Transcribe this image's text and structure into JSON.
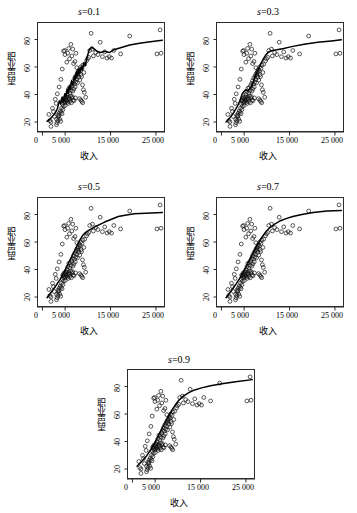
{
  "figure": {
    "background": "#ffffff",
    "panel_border_color": "#2b2b2b",
    "curve_color": "#000000",
    "point_color": "#111111"
  },
  "axis": {
    "xlabel": "收入",
    "ylabel": "职业声望",
    "xticks": [
      "0",
      "5 000",
      "15 000",
      "25 000"
    ],
    "xtick_values": [
      0,
      5000,
      15000,
      25000
    ],
    "yticks": [
      "20",
      "40",
      "60",
      "80"
    ],
    "ytick_values": [
      20,
      40,
      60,
      80
    ],
    "xlim": [
      -1200,
      27000
    ],
    "ylim": [
      12,
      92
    ]
  },
  "titles": {
    "p1": "s=0.1",
    "p2": "s=0.3",
    "p3": "s=0.5",
    "p4": "s=0.7",
    "p5": "s=0.9",
    "sym": "s",
    "eq1": "=0.1",
    "eq2": "=0.3",
    "eq3": "=0.5",
    "eq4": "=0.7",
    "eq5": "=0.9"
  },
  "chart_data": {
    "type": "scatter",
    "title": "",
    "xlabel": "收入",
    "ylabel": "职业声望",
    "xlim": [
      -1200,
      27000
    ],
    "ylim": [
      12,
      92
    ],
    "grid": false,
    "legend": "none",
    "panels": [
      {
        "name": "s=0.1",
        "span": 0.1
      },
      {
        "name": "s=0.3",
        "span": 0.3
      },
      {
        "name": "s=0.5",
        "span": 0.5
      },
      {
        "name": "s=0.7",
        "span": 0.7
      },
      {
        "name": "s=0.9",
        "span": 0.9
      }
    ],
    "points": [
      [
        1656,
        16.8
      ],
      [
        1656,
        20.0
      ],
      [
        2880,
        18.0
      ],
      [
        2890,
        22.0
      ],
      [
        3000,
        19.5
      ],
      [
        3180,
        21.0
      ],
      [
        3200,
        25.0
      ],
      [
        3300,
        23.5
      ],
      [
        3400,
        24.5
      ],
      [
        3500,
        26.5
      ],
      [
        3600,
        22.0
      ],
      [
        3700,
        28.0
      ],
      [
        3800,
        20.5
      ],
      [
        3900,
        27.0
      ],
      [
        4000,
        30.0
      ],
      [
        4100,
        26.0
      ],
      [
        4200,
        33.0
      ],
      [
        4300,
        29.0
      ],
      [
        4400,
        31.5
      ],
      [
        4500,
        35.0
      ],
      [
        4600,
        34.0
      ],
      [
        4700,
        37.0
      ],
      [
        4800,
        32.0
      ],
      [
        4900,
        36.0
      ],
      [
        5000,
        38.5
      ],
      [
        5100,
        35.5
      ],
      [
        5200,
        40.0
      ],
      [
        5300,
        34.5
      ],
      [
        5400,
        42.0
      ],
      [
        5500,
        38.0
      ],
      [
        5600,
        44.5
      ],
      [
        5700,
        36.5
      ],
      [
        5800,
        41.0
      ],
      [
        5900,
        45.0
      ],
      [
        6000,
        39.0
      ],
      [
        6100,
        43.0
      ],
      [
        6200,
        46.5
      ],
      [
        6300,
        37.5
      ],
      [
        6400,
        48.0
      ],
      [
        6500,
        42.5
      ],
      [
        6600,
        50.0
      ],
      [
        6700,
        44.0
      ],
      [
        6800,
        47.5
      ],
      [
        6900,
        52.0
      ],
      [
        7000,
        45.5
      ],
      [
        7100,
        49.0
      ],
      [
        7200,
        53.5
      ],
      [
        7300,
        51.0
      ],
      [
        7400,
        55.0
      ],
      [
        7500,
        48.5
      ],
      [
        7600,
        54.0
      ],
      [
        7700,
        56.5
      ],
      [
        7800,
        52.5
      ],
      [
        7900,
        58.0
      ],
      [
        8000,
        50.5
      ],
      [
        8100,
        57.0
      ],
      [
        8200,
        60.0
      ],
      [
        8300,
        54.5
      ],
      [
        8400,
        53.0
      ],
      [
        8500,
        59.0
      ],
      [
        8600,
        47.0
      ],
      [
        8700,
        61.5
      ],
      [
        8800,
        43.5
      ],
      [
        8900,
        56.0
      ],
      [
        9000,
        41.5
      ],
      [
        9100,
        62.0
      ],
      [
        9300,
        38.0
      ],
      [
        9500,
        64.5
      ],
      [
        9700,
        66.0
      ],
      [
        10000,
        67.0
      ],
      [
        10200,
        72.0
      ],
      [
        10500,
        84.5
      ],
      [
        10800,
        73.0
      ],
      [
        11000,
        68.0
      ],
      [
        11500,
        70.5
      ],
      [
        12000,
        69.0
      ],
      [
        12500,
        78.0
      ],
      [
        13000,
        67.5
      ],
      [
        13500,
        71.0
      ],
      [
        14000,
        66.5
      ],
      [
        14500,
        67.5
      ],
      [
        15000,
        66.5
      ],
      [
        15500,
        72.0
      ],
      [
        17000,
        69.5
      ],
      [
        19000,
        82.5
      ],
      [
        25000,
        69.5
      ],
      [
        25700,
        87.0
      ],
      [
        25900,
        70.0
      ],
      [
        1200,
        25.5
      ],
      [
        1400,
        21.0
      ],
      [
        2000,
        30.0
      ],
      [
        2200,
        27.5
      ],
      [
        2400,
        24.0
      ],
      [
        2600,
        36.5
      ],
      [
        2800,
        33.5
      ],
      [
        3050,
        40.5
      ],
      [
        3450,
        45.5
      ],
      [
        3850,
        51.0
      ],
      [
        4150,
        58.5
      ],
      [
        4450,
        71.5
      ],
      [
        4650,
        72.0
      ],
      [
        4750,
        69.0
      ],
      [
        5150,
        63.5
      ],
      [
        5350,
        70.0
      ],
      [
        5550,
        73.5
      ],
      [
        5750,
        66.0
      ],
      [
        6050,
        76.5
      ],
      [
        6250,
        68.0
      ],
      [
        6450,
        73.0
      ],
      [
        6650,
        62.5
      ],
      [
        6950,
        64.0
      ],
      [
        7150,
        70.0
      ],
      [
        7350,
        59.5
      ],
      [
        7650,
        56.0
      ],
      [
        7950,
        37.0
      ],
      [
        8250,
        36.0
      ],
      [
        8450,
        35.0
      ],
      [
        8650,
        34.0
      ],
      [
        4250,
        36.0
      ],
      [
        4350,
        35.5
      ],
      [
        4550,
        37.5
      ],
      [
        4850,
        34.5
      ],
      [
        5050,
        38.0
      ],
      [
        5250,
        36.5
      ],
      [
        5450,
        33.5
      ],
      [
        5650,
        37.0
      ],
      [
        5850,
        35.0
      ],
      [
        6150,
        34.0
      ],
      [
        6350,
        38.5
      ],
      [
        6550,
        36.0
      ],
      [
        6750,
        35.5
      ],
      [
        7050,
        37.5
      ]
    ],
    "curves": {
      "s01": [
        [
          800,
          20.5
        ],
        [
          1700,
          23.0
        ],
        [
          2600,
          26.5
        ],
        [
          3100,
          30.0
        ],
        [
          3500,
          35.5
        ],
        [
          3800,
          33.0
        ],
        [
          4100,
          38.0
        ],
        [
          4400,
          35.0
        ],
        [
          4700,
          40.5
        ],
        [
          5000,
          38.5
        ],
        [
          5200,
          44.0
        ],
        [
          5400,
          41.0
        ],
        [
          5700,
          46.5
        ],
        [
          5900,
          43.5
        ],
        [
          6200,
          50.0
        ],
        [
          6500,
          47.0
        ],
        [
          6800,
          53.5
        ],
        [
          7000,
          51.0
        ],
        [
          7300,
          57.0
        ],
        [
          7500,
          54.0
        ],
        [
          7800,
          58.5
        ],
        [
          8000,
          56.0
        ],
        [
          8300,
          60.0
        ],
        [
          8600,
          58.0
        ],
        [
          8900,
          63.0
        ],
        [
          9200,
          61.0
        ],
        [
          9600,
          67.0
        ],
        [
          10100,
          72.5
        ],
        [
          10600,
          74.5
        ],
        [
          11200,
          73.0
        ],
        [
          11800,
          71.5
        ],
        [
          12600,
          70.5
        ],
        [
          13500,
          71.5
        ],
        [
          14500,
          70.5
        ],
        [
          15500,
          72.5
        ],
        [
          17000,
          74.0
        ],
        [
          19000,
          76.0
        ],
        [
          21500,
          77.5
        ],
        [
          24000,
          78.5
        ],
        [
          26200,
          79.5
        ]
      ],
      "s03": [
        [
          800,
          20.0
        ],
        [
          1600,
          23.0
        ],
        [
          2500,
          27.0
        ],
        [
          3300,
          31.5
        ],
        [
          3900,
          36.0
        ],
        [
          4300,
          40.0
        ],
        [
          4700,
          42.0
        ],
        [
          5100,
          43.5
        ],
        [
          5500,
          42.5
        ],
        [
          5900,
          43.5
        ],
        [
          6300,
          45.5
        ],
        [
          6700,
          48.5
        ],
        [
          7100,
          52.5
        ],
        [
          7500,
          55.5
        ],
        [
          7900,
          58.5
        ],
        [
          8300,
          61.5
        ],
        [
          8700,
          64.0
        ],
        [
          9100,
          66.5
        ],
        [
          9600,
          69.0
        ],
        [
          10200,
          71.0
        ],
        [
          11000,
          72.0
        ],
        [
          12000,
          72.5
        ],
        [
          13500,
          73.5
        ],
        [
          15500,
          75.0
        ],
        [
          18000,
          76.5
        ],
        [
          21000,
          78.0
        ],
        [
          24000,
          79.0
        ],
        [
          26200,
          79.8
        ]
      ],
      "s05": [
        [
          800,
          19.5
        ],
        [
          1700,
          23.5
        ],
        [
          2700,
          28.0
        ],
        [
          3600,
          32.5
        ],
        [
          4300,
          36.5
        ],
        [
          4900,
          40.5
        ],
        [
          5500,
          44.5
        ],
        [
          6100,
          48.5
        ],
        [
          6700,
          52.5
        ],
        [
          7200,
          56.0
        ],
        [
          7700,
          59.5
        ],
        [
          8200,
          62.5
        ],
        [
          8700,
          65.0
        ],
        [
          9300,
          67.0
        ],
        [
          10000,
          68.5
        ],
        [
          11000,
          70.5
        ],
        [
          12200,
          72.5
        ],
        [
          13500,
          74.5
        ],
        [
          15000,
          76.5
        ],
        [
          16500,
          78.5
        ],
        [
          18000,
          79.5
        ],
        [
          20000,
          80.5
        ],
        [
          22500,
          81.0
        ],
        [
          26200,
          81.5
        ]
      ],
      "s07": [
        [
          800,
          19.5
        ],
        [
          1800,
          24.0
        ],
        [
          2800,
          28.5
        ],
        [
          3700,
          33.0
        ],
        [
          4500,
          37.5
        ],
        [
          5200,
          42.0
        ],
        [
          5900,
          46.5
        ],
        [
          6600,
          51.0
        ],
        [
          7200,
          55.0
        ],
        [
          7800,
          58.5
        ],
        [
          8400,
          62.0
        ],
        [
          9000,
          65.0
        ],
        [
          9700,
          68.0
        ],
        [
          10500,
          70.5
        ],
        [
          11500,
          73.0
        ],
        [
          12800,
          75.5
        ],
        [
          14000,
          77.0
        ],
        [
          15500,
          78.5
        ],
        [
          17500,
          80.0
        ],
        [
          20000,
          81.5
        ],
        [
          23000,
          82.5
        ],
        [
          26200,
          83.0
        ]
      ],
      "s09": [
        [
          800,
          22.0
        ],
        [
          1800,
          25.5
        ],
        [
          2900,
          29.5
        ],
        [
          3800,
          34.0
        ],
        [
          4600,
          38.5
        ],
        [
          5300,
          43.0
        ],
        [
          6000,
          47.5
        ],
        [
          6700,
          52.0
        ],
        [
          7300,
          56.0
        ],
        [
          7900,
          59.5
        ],
        [
          8500,
          63.0
        ],
        [
          9200,
          66.5
        ],
        [
          10000,
          70.0
        ],
        [
          11000,
          73.0
        ],
        [
          12200,
          75.5
        ],
        [
          13500,
          77.5
        ],
        [
          15000,
          79.0
        ],
        [
          17000,
          80.5
        ],
        [
          19500,
          82.0
        ],
        [
          22500,
          83.5
        ],
        [
          26200,
          85.0
        ]
      ]
    }
  }
}
